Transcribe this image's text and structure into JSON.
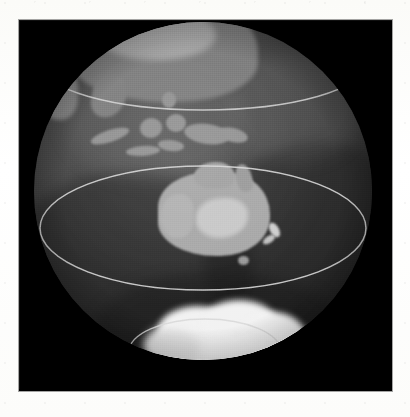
{
  "page": {
    "background_color": "#fdfdfb",
    "plate_color": "#000000"
  },
  "image": {
    "title": "Earth globe — orthographic view centred on Australia",
    "projection": "orthographic",
    "palette": "grayscale",
    "background_color": "#000000",
    "globe_base_color": "#4a4a4a",
    "land_color": "#a9a9a9",
    "ice_color": "#f2f2f2",
    "graticule_color": "#d8d8d8"
  },
  "globe": {
    "center_x": 186,
    "center_y": 189,
    "radius": 169,
    "label": "earth-globe"
  },
  "graticule": {
    "label": "latitude-circles",
    "color": "#d8d8d8",
    "stroke_width": 1.2,
    "circles": [
      {
        "name": "tropic-of-cancer",
        "latitude_deg": 23.5,
        "cy": 42,
        "ry": 46
      },
      {
        "name": "tropic-of-capricorn",
        "latitude_deg": -23.5,
        "cy": 206,
        "ry": 62
      },
      {
        "name": "antarctic-circle",
        "latitude_deg": -66.5,
        "cy": 330,
        "ry": 33
      }
    ]
  },
  "features": [
    {
      "name": "australia",
      "kind": "continent",
      "brightness": "bright"
    },
    {
      "name": "new-guinea",
      "kind": "island",
      "brightness": "medium"
    },
    {
      "name": "indonesia",
      "kind": "archipelago",
      "brightness": "medium"
    },
    {
      "name": "southeast-asia",
      "kind": "continent",
      "brightness": "medium"
    },
    {
      "name": "india",
      "kind": "continent",
      "brightness": "medium"
    },
    {
      "name": "new-zealand",
      "kind": "island",
      "brightness": "bright"
    },
    {
      "name": "tasmania",
      "kind": "island",
      "brightness": "medium"
    },
    {
      "name": "antarctica",
      "kind": "ice-sheet",
      "brightness": "very-bright"
    }
  ],
  "chart_data": {
    "type": "heatmap",
    "xlabel": "",
    "ylabel": "",
    "legend_position": "none",
    "grid": true,
    "annotations": [
      "Tropic of Cancer",
      "Tropic of Capricorn",
      "Antarctic Circle"
    ]
  }
}
